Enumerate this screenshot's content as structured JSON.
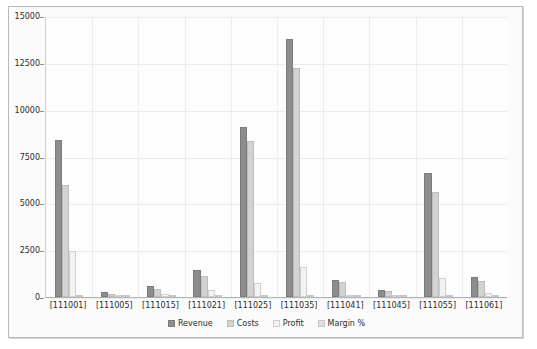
{
  "chart_data": {
    "type": "bar",
    "title": "",
    "subtitle": "",
    "xlabel": "",
    "ylabel": "",
    "grid": true,
    "legend_position": "bottom",
    "ylim": [
      0,
      15000
    ],
    "yticks": [
      0,
      2500,
      5000,
      7500,
      10000,
      12500,
      15000
    ],
    "ytick_labels": [
      "0",
      "2500",
      "5000",
      "7500",
      "10000",
      "12500",
      "15000"
    ],
    "categories": [
      "[111001]",
      "[111005]",
      "[111015]",
      "[111021]",
      "[111025]",
      "[111035]",
      "[111041]",
      "[111045]",
      "[111055]",
      "[111061]"
    ],
    "series": [
      {
        "name": "Revenue",
        "color": "#8d8d8d",
        "values": [
          8400,
          250,
          600,
          1450,
          9100,
          13750,
          900,
          350,
          6600,
          1050
        ]
      },
      {
        "name": "Costs",
        "color": "#d2d2d2",
        "values": [
          6000,
          150,
          450,
          1100,
          8350,
          12200,
          800,
          300,
          5600,
          850
        ]
      },
      {
        "name": "Profit",
        "color": "#f2f2f2",
        "values": [
          2450,
          100,
          150,
          350,
          750,
          1600,
          100,
          50,
          1000,
          200
        ]
      },
      {
        "name": "Margin %",
        "color": "#dedede",
        "values": [
          60,
          40,
          25,
          24,
          8,
          12,
          11,
          14,
          15,
          19
        ]
      }
    ]
  },
  "colors": {
    "panel_background": "#fbfbfb",
    "plot_background": "#fdfdfd",
    "panel_border": "#b9b9b9",
    "gridline": "#e9edf1",
    "axis_line": "#b4b4b4",
    "text": "#2b2b2b"
  }
}
